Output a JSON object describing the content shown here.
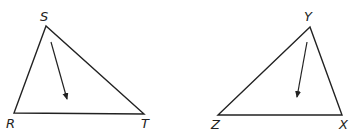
{
  "triangles": [
    {
      "vertices": {
        "top": "S",
        "left": "R",
        "right": "T"
      },
      "points": {
        "S": [
          46,
          26
        ],
        "R": [
          14,
          113
        ],
        "T": [
          144,
          114
        ]
      },
      "arrow": {
        "from": [
          51,
          42
        ],
        "to": [
          68,
          101
        ]
      }
    },
    {
      "vertices": {
        "top": "Y",
        "left": "Z",
        "right": "X"
      },
      "points": {
        "Y": [
          310,
          27
        ],
        "Z": [
          218,
          115
        ],
        "X": [
          342,
          115
        ]
      },
      "arrow": {
        "from": [
          307,
          42
        ],
        "to": [
          297,
          99
        ]
      }
    }
  ],
  "colors": {
    "stroke": "#222222",
    "background": "#ffffff"
  }
}
